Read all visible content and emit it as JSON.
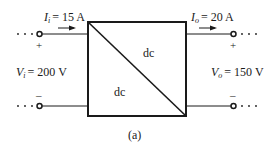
{
  "diagram": {
    "caption": "(a)",
    "converter": {
      "upper_label": "dc",
      "lower_label": "dc"
    },
    "input": {
      "current_symbol": "I",
      "current_sub": "i",
      "current_value": "= 15 A",
      "voltage_symbol": "V",
      "voltage_sub": "i",
      "voltage_value": "= 200 V",
      "plus": "+",
      "minus": "–"
    },
    "output": {
      "current_symbol": "I",
      "current_sub": "o",
      "current_value": "= 20 A",
      "voltage_symbol": "V",
      "voltage_sub": "o",
      "voltage_value": "= 150 V",
      "plus": "+",
      "minus": "–"
    },
    "line_color": "#1a1a1a"
  }
}
